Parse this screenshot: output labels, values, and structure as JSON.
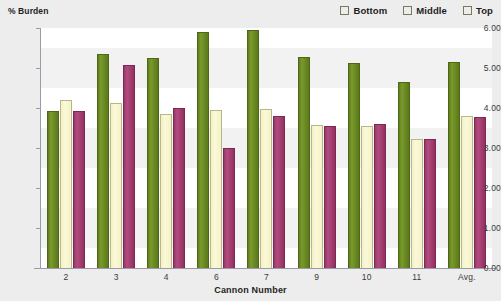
{
  "chart_data": {
    "type": "bar",
    "title": "",
    "xlabel": "Cannon Number",
    "ylabel": "% Burden",
    "categories": [
      "2",
      "3",
      "4",
      "6",
      "7",
      "9",
      "10",
      "11",
      "Avg."
    ],
    "series": [
      {
        "name": "Bottom",
        "color": "#6b8a22",
        "values": [
          3.92,
          5.36,
          5.25,
          5.9,
          5.96,
          5.28,
          5.13,
          4.65,
          5.16
        ]
      },
      {
        "name": "Middle",
        "color": "#faf8d4",
        "values": [
          4.21,
          4.12,
          3.85,
          3.96,
          3.98,
          3.57,
          3.56,
          3.23,
          3.81
        ]
      },
      {
        "name": "Top",
        "color": "#a33f70",
        "values": [
          3.92,
          5.08,
          4.01,
          3.01,
          3.79,
          3.56,
          3.6,
          3.22,
          3.78
        ]
      }
    ],
    "ylim": [
      0,
      6
    ],
    "y_ticks": [
      "0.00",
      "1.00",
      "2.00",
      "3.00",
      "4.00",
      "5.00",
      "6.00"
    ],
    "y_tick_values": [
      0,
      1,
      2,
      3,
      4,
      5,
      6
    ],
    "grid": false,
    "legend_position": "top-right",
    "background_color": "#ededed",
    "plot_background_color": "#ffffff"
  },
  "legend": {
    "items": [
      {
        "label": "Bottom",
        "swatch": "legend-swatch-bottom"
      },
      {
        "label": "Middle",
        "swatch": "legend-swatch-middle"
      },
      {
        "label": "Top",
        "swatch": "legend-swatch-top"
      }
    ]
  }
}
